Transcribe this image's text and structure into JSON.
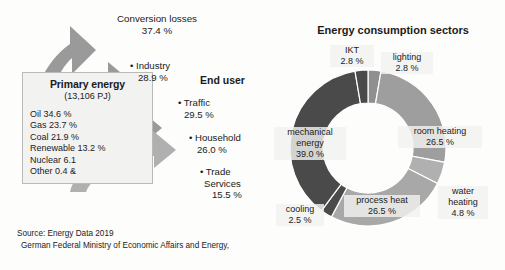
{
  "left_panel": {
    "primary_energy": {
      "title": "Primary energy",
      "subtitle": "(13,106 PJ)",
      "items": [
        "Oil 34.6 %",
        "Gas 23.7 %",
        "Coal 21.9 %",
        "Renewable 13.2 %",
        "Nuclear 6.1",
        "Other 0.4 &"
      ]
    },
    "conversion_losses": {
      "label": "Conversion losses",
      "value": "37.4 %"
    },
    "end_user_title": "End user",
    "end_users": [
      {
        "bullet": "• Industry",
        "value": "28.9 %"
      },
      {
        "bullet": "• Traffic",
        "value": "29.5 %"
      },
      {
        "bullet": "• Household",
        "value": "26.0 %"
      },
      {
        "bullet": "• Trade",
        "line2": "Services",
        "value": "15.5 %"
      }
    ],
    "source": {
      "line1": "Source: Energy Data 2019",
      "line2": "German Federal Ministry of Economic Affairs and Energy,"
    }
  },
  "right_panel": {
    "title": "Energy consumption sectors"
  },
  "chart_data": {
    "type": "pie",
    "title": "Energy consumption sectors",
    "subtype": "donut",
    "legend": "labels-outside",
    "categories": [
      "mechanical energy",
      "IKT",
      "lighting",
      "room heating",
      "water heating",
      "process heat",
      "cooling"
    ],
    "values": [
      39.0,
      2.8,
      2.8,
      26.5,
      4.8,
      26.5,
      2.5
    ],
    "labels": [
      "mechanical\nenergy\n39.0 %",
      "IKT\n2.8 %",
      "lighting\n2.8 %",
      "room heating\n26.5 %",
      "water\nheating\n4.8 %",
      "process heat\n26.5 %",
      "cooling\n2.5 %"
    ],
    "colors": [
      "#4a4a4a",
      "#4a4a4a",
      "#8f8f8f",
      "#9e9e9e",
      "#b0b0b0",
      "#a8a8a8",
      "#4a4a4a"
    ],
    "units": "%",
    "secondary_chart": {
      "type": "bar",
      "title": "Primary energy (13,106 PJ)",
      "categories": [
        "Oil",
        "Gas",
        "Coal",
        "Renewable",
        "Nuclear",
        "Other"
      ],
      "values": [
        34.6,
        23.7,
        21.9,
        13.2,
        6.1,
        0.4
      ],
      "ylabel": "share",
      "units": "%"
    },
    "flow_chart": {
      "type": "bar",
      "title": "End user",
      "categories": [
        "Conversion losses",
        "Industry",
        "Traffic",
        "Household",
        "Trade Services"
      ],
      "values": [
        37.4,
        28.9,
        29.5,
        26.0,
        15.5
      ],
      "units": "%"
    }
  },
  "palette": {
    "arrow_gray": "#9a9a9a",
    "arrow_light": "#b5b5b5",
    "dark_segment": "#4a4a4a",
    "mid_segment": "#9e9e9e",
    "light_segment": "#b0b0b0",
    "box_fill": "#f2f2f0",
    "box_border": "#b9b9b9"
  }
}
